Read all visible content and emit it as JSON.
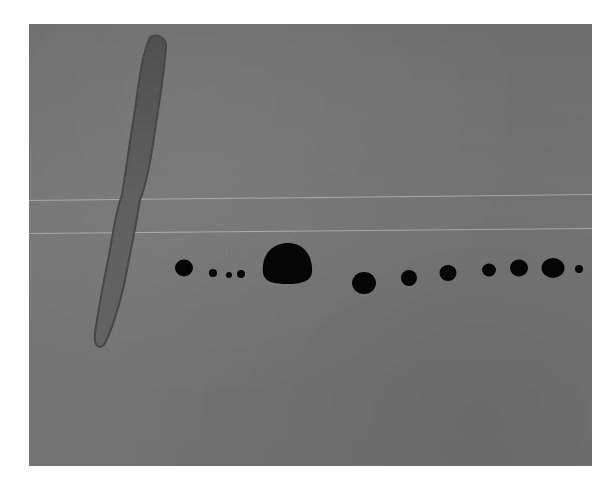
{
  "artwork": {
    "background_color": "#737373",
    "stroke": {
      "description": "long diagonal brush stroke",
      "color": "#595959",
      "edge_color": "#3f3f3f"
    },
    "dots": {
      "color": "#050505",
      "count": 15,
      "items": [
        {
          "cx": 184,
          "cy": 268,
          "rx": 9,
          "ry": 8.5
        },
        {
          "cx": 213,
          "cy": 273,
          "rx": 4,
          "ry": 4
        },
        {
          "cx": 229,
          "cy": 275,
          "rx": 3,
          "ry": 3
        },
        {
          "cx": 241,
          "cy": 274,
          "rx": 4,
          "ry": 4
        },
        {
          "cx": 287,
          "cy": 265,
          "rx": 24,
          "ry": 20
        },
        {
          "cx": 364,
          "cy": 283,
          "rx": 12,
          "ry": 11
        },
        {
          "cx": 409,
          "cy": 278,
          "rx": 8,
          "ry": 8
        },
        {
          "cx": 448,
          "cy": 273,
          "rx": 8.5,
          "ry": 8
        },
        {
          "cx": 489,
          "cy": 270,
          "rx": 7,
          "ry": 6.5
        },
        {
          "cx": 519,
          "cy": 268,
          "rx": 9,
          "ry": 8.5
        },
        {
          "cx": 553,
          "cy": 268,
          "rx": 11.5,
          "ry": 10
        },
        {
          "cx": 579,
          "cy": 269,
          "rx": 4,
          "ry": 4
        }
      ]
    },
    "scratch_lines": [
      {
        "top": 176,
        "left": 0,
        "width": 563
      },
      {
        "top": 209,
        "left": 0,
        "width": 563
      }
    ]
  }
}
